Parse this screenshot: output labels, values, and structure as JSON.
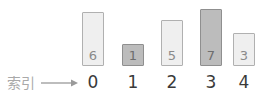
{
  "caption": {
    "label": "索引",
    "arrow_icon": "arrow-right-icon",
    "arrow_color": "#9a9a9a"
  },
  "colors": {
    "bar_plain_fill": "#efefef",
    "bar_plain_border": "#b0b0b0",
    "bar_highlight_fill": "#bcbcbc",
    "bar_highlight_border": "#8f8f8f",
    "value_text": "#8a8a8a",
    "index_text": "#3a3a3a",
    "caption_text": "#a9a9a9",
    "background": "#ffffff"
  },
  "chart_data": {
    "type": "bar",
    "title": "",
    "subtitle": "",
    "xlabel": "索引",
    "ylabel": "",
    "grid": false,
    "legend": "none",
    "categories": [
      "0",
      "1",
      "2",
      "3",
      "4"
    ],
    "values": [
      6,
      1,
      5,
      7,
      3
    ],
    "value_labels": [
      "6",
      "1",
      "5",
      "7",
      "3"
    ],
    "tick_labels": [
      "0",
      "1",
      "2",
      "3",
      "4"
    ],
    "ylim": [
      0,
      7
    ],
    "highlighted": [
      false,
      true,
      false,
      true,
      false
    ],
    "annotations": [
      {
        "text": "索引",
        "points_to": "0"
      }
    ]
  },
  "bars": [
    {
      "index": "0",
      "value": "6",
      "x": 82,
      "y": 12,
      "width": 22,
      "height": 54,
      "highlight": false
    },
    {
      "index": "1",
      "value": "1",
      "x": 122,
      "y": 44,
      "width": 22,
      "height": 22,
      "highlight": true
    },
    {
      "index": "2",
      "value": "5",
      "x": 161,
      "y": 20,
      "width": 22,
      "height": 46,
      "highlight": false
    },
    {
      "index": "3",
      "value": "7",
      "x": 200,
      "y": 9,
      "width": 22,
      "height": 57,
      "highlight": true
    },
    {
      "index": "4",
      "value": "3",
      "x": 233,
      "y": 33,
      "width": 22,
      "height": 33,
      "highlight": false
    }
  ],
  "index_labels": [
    {
      "text": "0",
      "x": 82
    },
    {
      "text": "1",
      "x": 122
    },
    {
      "text": "2",
      "x": 161
    },
    {
      "text": "3",
      "x": 200
    },
    {
      "text": "4",
      "x": 233
    }
  ]
}
